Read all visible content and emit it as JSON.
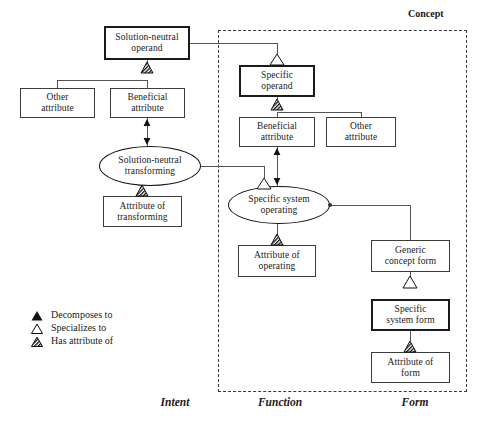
{
  "diagram": {
    "concept_frame_label": "Concept",
    "columns": [
      {
        "id": "intent",
        "label": "Intent"
      },
      {
        "id": "function",
        "label": "Function"
      },
      {
        "id": "form",
        "label": "Form"
      }
    ],
    "nodes": [
      {
        "id": "solution-neutral-operand",
        "label": "Solution-neutral operand",
        "line1": "Solution-neutral",
        "line2": "operand",
        "shape": "box",
        "emphasis": "thick",
        "x": 104,
        "y": 26,
        "w": 86,
        "h": 34
      },
      {
        "id": "other-attribute-intent",
        "label": "Other attribute",
        "line1": "Other",
        "line2": "attribute",
        "shape": "box",
        "emphasis": "thin",
        "x": 20,
        "y": 88,
        "w": 75,
        "h": 30
      },
      {
        "id": "beneficial-attribute-intent",
        "label": "Beneficial attribute",
        "line1": "Beneficial",
        "line2": "attribute",
        "shape": "box",
        "emphasis": "thin",
        "x": 110,
        "y": 88,
        "w": 75,
        "h": 30
      },
      {
        "id": "solution-neutral-transforming",
        "label": "Solution-neutral transforming",
        "line1": "Solution-neutral",
        "line2": "transforming",
        "shape": "ellipse",
        "emphasis": "thin",
        "x": 99,
        "y": 146,
        "w": 102,
        "h": 40
      },
      {
        "id": "attribute-of-transforming",
        "label": "Attribute of transforming",
        "line1": "Attribute of",
        "line2": "transforming",
        "shape": "box",
        "emphasis": "thin",
        "x": 103,
        "y": 196,
        "w": 79,
        "h": 31
      },
      {
        "id": "specific-operand",
        "label": "Specific operand",
        "line1": "Specific",
        "line2": "operand",
        "shape": "box",
        "emphasis": "thick",
        "x": 239,
        "y": 65,
        "w": 76,
        "h": 32
      },
      {
        "id": "beneficial-attribute-function",
        "label": "Beneficial attribute",
        "line1": "Beneficial",
        "line2": "attribute",
        "shape": "box",
        "emphasis": "thin",
        "x": 239,
        "y": 117,
        "w": 76,
        "h": 30
      },
      {
        "id": "other-attribute-function",
        "label": "Other attribute",
        "line1": "Other",
        "line2": "attribute",
        "shape": "box",
        "emphasis": "thin",
        "x": 326,
        "y": 117,
        "w": 70,
        "h": 30
      },
      {
        "id": "specific-system-operating",
        "label": "Specific system operating",
        "line1": "Specific system",
        "line2": "operating",
        "shape": "ellipse",
        "emphasis": "thin",
        "x": 228,
        "y": 186,
        "w": 102,
        "h": 38
      },
      {
        "id": "attribute-of-operating",
        "label": "Attribute of operating",
        "line1": "Attribute of",
        "line2": "operating",
        "shape": "box",
        "emphasis": "thin",
        "x": 238,
        "y": 245,
        "w": 78,
        "h": 32
      },
      {
        "id": "generic-concept-form",
        "label": "Generic concept form",
        "line1": "Generic",
        "line2": "concept form",
        "shape": "box",
        "emphasis": "thin",
        "x": 371,
        "y": 240,
        "w": 79,
        "h": 32
      },
      {
        "id": "specific-system-form",
        "label": "Specific system form",
        "line1": "Specific",
        "line2": "system form",
        "shape": "box",
        "emphasis": "thick",
        "x": 371,
        "y": 299,
        "w": 79,
        "h": 32
      },
      {
        "id": "attribute-of-form",
        "label": "Attribute of form",
        "line1": "Attribute of",
        "line2": "form",
        "shape": "box",
        "emphasis": "thin",
        "x": 371,
        "y": 352,
        "w": 79,
        "h": 31
      }
    ],
    "legend": [
      {
        "id": "decomposes-to",
        "glyph": "filled-triangle",
        "label": "Decomposes to"
      },
      {
        "id": "specializes-to",
        "glyph": "hollow-triangle",
        "label": "Specializes to"
      },
      {
        "id": "has-attribute-of",
        "glyph": "hatched-triangle",
        "label": "Has attribute of"
      }
    ],
    "caption": "",
    "colors": {
      "line": "#555555",
      "border": "#3c3c3c",
      "border_thick": "#1b1b1b",
      "frame_dashed": "#3a3a3a",
      "text": "#1a1a1a",
      "background": "#ffffff"
    }
  }
}
